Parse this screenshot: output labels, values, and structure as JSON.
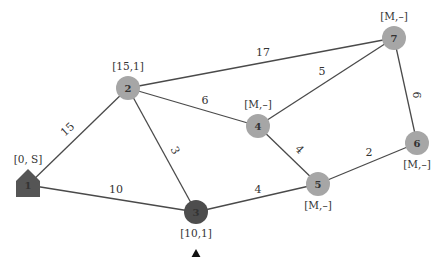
{
  "colors": {
    "node_default": "#a6a6a6",
    "node_source": "#555555",
    "node_current": "#4d4d4d",
    "edge": "#4a4a4a",
    "marker": "#111111"
  },
  "nodes": [
    {
      "id": "1",
      "label": "1",
      "tag": "[0, S]",
      "shape": "house",
      "x": 28,
      "y": 185,
      "state": "source"
    },
    {
      "id": "2",
      "label": "2",
      "tag": "[15,1]",
      "shape": "circle",
      "x": 128,
      "y": 88,
      "state": "labeled"
    },
    {
      "id": "3",
      "label": "3",
      "tag": "[10,1]",
      "shape": "circle",
      "x": 196,
      "y": 212,
      "state": "current"
    },
    {
      "id": "4",
      "label": "4",
      "tag": "[M,–]",
      "shape": "circle",
      "x": 258,
      "y": 126,
      "state": "unlabeled"
    },
    {
      "id": "5",
      "label": "5",
      "tag": "[M,–]",
      "shape": "circle",
      "x": 318,
      "y": 184,
      "state": "unlabeled"
    },
    {
      "id": "6",
      "label": "6",
      "tag": "[M,–]",
      "shape": "circle",
      "x": 417,
      "y": 143,
      "state": "unlabeled"
    },
    {
      "id": "7",
      "label": "7",
      "tag": "[M,–]",
      "shape": "circle",
      "x": 394,
      "y": 38,
      "state": "unlabeled"
    }
  ],
  "edges": [
    {
      "from": "1",
      "to": "2",
      "weight": "15",
      "lx": 70,
      "ly": 132,
      "rot": -42
    },
    {
      "from": "1",
      "to": "3",
      "weight": "10",
      "lx": 116,
      "ly": 193,
      "rot": 0
    },
    {
      "from": "2",
      "to": "3",
      "weight": "3",
      "lx": 172,
      "ly": 152,
      "rot": 62
    },
    {
      "from": "2",
      "to": "4",
      "weight": "6",
      "lx": 205,
      "ly": 104,
      "rot": 0
    },
    {
      "from": "2",
      "to": "7",
      "weight": "17",
      "lx": 263,
      "ly": 56,
      "rot": 0
    },
    {
      "from": "3",
      "to": "5",
      "weight": "4",
      "lx": 258,
      "ly": 193,
      "rot": 0
    },
    {
      "from": "4",
      "to": "5",
      "weight": "4",
      "lx": 297,
      "ly": 152,
      "rot": 45
    },
    {
      "from": "4",
      "to": "7",
      "weight": "5",
      "lx": 322,
      "ly": 75,
      "rot": 0
    },
    {
      "from": "5",
      "to": "6",
      "weight": "2",
      "lx": 369,
      "ly": 156,
      "rot": 0
    },
    {
      "from": "7",
      "to": "6",
      "weight": "6",
      "lx": 413,
      "ly": 95,
      "rot": 90
    }
  ],
  "current_marker": {
    "node": "3",
    "symbol": "▲"
  }
}
